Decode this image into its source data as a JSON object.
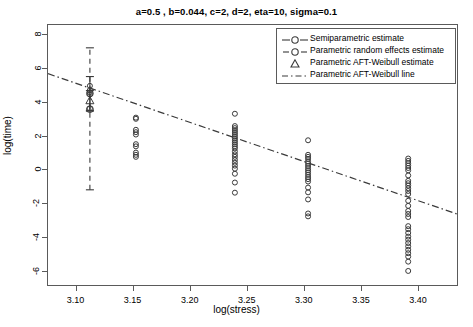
{
  "chart_data": {
    "type": "scatter",
    "title": "a=0.5 , b=0.044, c=2, d=2, eta=10, sigma=0.1",
    "xlabel": "log(stress)",
    "ylabel": "log(time)",
    "xlim": [
      3.075,
      3.435
    ],
    "ylim": [
      -6.9,
      8.6
    ],
    "xticks": [
      3.1,
      3.15,
      3.2,
      3.25,
      3.3,
      3.35,
      3.4
    ],
    "xtick_labels": [
      "3.10",
      "3.15",
      "3.20",
      "3.25",
      "3.30",
      "3.35",
      "3.40"
    ],
    "yticks": [
      8,
      6,
      4,
      2,
      0,
      -2,
      -4,
      -6
    ],
    "ytick_labels": [
      "8",
      "6",
      "4",
      "2",
      "0",
      "-2",
      "-4",
      "-6"
    ],
    "grid": false,
    "legend_position": "top-right",
    "legend": [
      {
        "label": "Semiparametric estimate",
        "marker": "circle",
        "line": "solid"
      },
      {
        "label": "Parametric  random effects estimate",
        "marker": "circle",
        "line": "dashed"
      },
      {
        "label": "Parametric AFT-Weibull estimate",
        "marker": "triangle",
        "line": "none"
      },
      {
        "label": "Parametric AFT-Weibull line",
        "marker": "none",
        "line": "dashdot"
      }
    ],
    "series": [
      {
        "name": "observations",
        "marker": "open-circle",
        "color": "#333333",
        "points": [
          {
            "x": 3.1117,
            "y": 3.66
          },
          {
            "x": 3.1117,
            "y": 4.5
          },
          {
            "x": 3.1117,
            "y": 4.62
          },
          {
            "x": 3.1117,
            "y": 4.75
          },
          {
            "x": 3.1117,
            "y": 5.0
          },
          {
            "x": 3.152,
            "y": 3.12
          },
          {
            "x": 3.152,
            "y": 3.05
          },
          {
            "x": 3.152,
            "y": 2.4
          },
          {
            "x": 3.152,
            "y": 2.26
          },
          {
            "x": 3.152,
            "y": 2.12
          },
          {
            "x": 3.152,
            "y": 1.55
          },
          {
            "x": 3.152,
            "y": 1.42
          },
          {
            "x": 3.152,
            "y": 1.05
          },
          {
            "x": 3.152,
            "y": 0.92
          },
          {
            "x": 3.152,
            "y": 0.8
          },
          {
            "x": 3.2387,
            "y": 3.35
          },
          {
            "x": 3.2387,
            "y": 2.62
          },
          {
            "x": 3.2387,
            "y": 2.5
          },
          {
            "x": 3.2387,
            "y": 2.38
          },
          {
            "x": 3.2387,
            "y": 2.26
          },
          {
            "x": 3.2387,
            "y": 2.14
          },
          {
            "x": 3.2387,
            "y": 2.02
          },
          {
            "x": 3.2387,
            "y": 1.9
          },
          {
            "x": 3.2387,
            "y": 1.78
          },
          {
            "x": 3.2387,
            "y": 1.66
          },
          {
            "x": 3.2387,
            "y": 1.54
          },
          {
            "x": 3.2387,
            "y": 1.42
          },
          {
            "x": 3.2387,
            "y": 1.3
          },
          {
            "x": 3.2387,
            "y": 1.12
          },
          {
            "x": 3.2387,
            "y": 0.95
          },
          {
            "x": 3.2387,
            "y": 0.8
          },
          {
            "x": 3.2387,
            "y": 0.62
          },
          {
            "x": 3.2387,
            "y": 0.45
          },
          {
            "x": 3.2387,
            "y": 0.28
          },
          {
            "x": 3.2387,
            "y": 0.1
          },
          {
            "x": 3.2387,
            "y": -0.2
          },
          {
            "x": 3.2387,
            "y": -0.72
          },
          {
            "x": 3.2387,
            "y": -1.32
          },
          {
            "x": 3.3028,
            "y": 1.78
          },
          {
            "x": 3.3028,
            "y": 0.92
          },
          {
            "x": 3.3028,
            "y": 0.8
          },
          {
            "x": 3.3028,
            "y": 0.68
          },
          {
            "x": 3.3028,
            "y": 0.52
          },
          {
            "x": 3.3028,
            "y": 0.4
          },
          {
            "x": 3.3028,
            "y": 0.26
          },
          {
            "x": 3.3028,
            "y": 0.12
          },
          {
            "x": 3.3028,
            "y": 0.0
          },
          {
            "x": 3.3028,
            "y": -0.12
          },
          {
            "x": 3.3028,
            "y": -0.26
          },
          {
            "x": 3.3028,
            "y": -0.4
          },
          {
            "x": 3.3028,
            "y": -0.52
          },
          {
            "x": 3.3028,
            "y": -0.66
          },
          {
            "x": 3.3028,
            "y": -1.02
          },
          {
            "x": 3.3028,
            "y": -1.3
          },
          {
            "x": 3.3028,
            "y": -1.72
          },
          {
            "x": 3.3028,
            "y": -2.55
          },
          {
            "x": 3.3028,
            "y": -2.72
          },
          {
            "x": 3.3905,
            "y": 0.7
          },
          {
            "x": 3.3905,
            "y": 0.56
          },
          {
            "x": 3.3905,
            "y": 0.42
          },
          {
            "x": 3.3905,
            "y": 0.28
          },
          {
            "x": 3.3905,
            "y": 0.14
          },
          {
            "x": 3.3905,
            "y": 0.0
          },
          {
            "x": 3.3905,
            "y": -0.3
          },
          {
            "x": 3.3905,
            "y": -0.62
          },
          {
            "x": 3.3905,
            "y": -0.76
          },
          {
            "x": 3.3905,
            "y": -0.9
          },
          {
            "x": 3.3905,
            "y": -1.06
          },
          {
            "x": 3.3905,
            "y": -1.22
          },
          {
            "x": 3.3905,
            "y": -1.4
          },
          {
            "x": 3.3905,
            "y": -1.8
          },
          {
            "x": 3.3905,
            "y": -2.1
          },
          {
            "x": 3.3905,
            "y": -2.4
          },
          {
            "x": 3.3905,
            "y": -2.58
          },
          {
            "x": 3.3905,
            "y": -2.76
          },
          {
            "x": 3.3905,
            "y": -3.3
          },
          {
            "x": 3.3905,
            "y": -3.48
          },
          {
            "x": 3.3905,
            "y": -3.7
          },
          {
            "x": 3.3905,
            "y": -3.92
          },
          {
            "x": 3.3905,
            "y": -4.1
          },
          {
            "x": 3.3905,
            "y": -4.3
          },
          {
            "x": 3.3905,
            "y": -4.5
          },
          {
            "x": 3.3905,
            "y": -4.7
          },
          {
            "x": 3.3905,
            "y": -4.9
          },
          {
            "x": 3.3905,
            "y": -5.1
          },
          {
            "x": 3.3905,
            "y": -5.4
          },
          {
            "x": 3.3905,
            "y": -5.95
          }
        ]
      },
      {
        "name": "Semiparametric estimate",
        "marker": "circle",
        "points": [
          {
            "x": 3.1117,
            "y": 4.55
          }
        ],
        "errorbar": {
          "x": 3.1117,
          "low": 3.5,
          "high": 5.55,
          "style": "solid"
        }
      },
      {
        "name": "Parametric random effects estimate",
        "marker": "circle",
        "points": [
          {
            "x": 3.1117,
            "y": 3.62
          }
        ],
        "errorbar": {
          "x": 3.1117,
          "low": -1.15,
          "high": 7.25,
          "style": "dashed"
        }
      },
      {
        "name": "Parametric AFT-Weibull estimate",
        "marker": "triangle",
        "points": [
          {
            "x": 3.1117,
            "y": 4.12
          }
        ],
        "errorbar": {
          "x": 3.1117,
          "low": 3.55,
          "high": 4.72,
          "style": "solid"
        }
      }
    ],
    "fit_line": {
      "name": "Parametric AFT-Weibull line",
      "style": "dashdot",
      "x0": 3.075,
      "y0": 5.72,
      "x1": 3.435,
      "y1": -2.62
    }
  }
}
